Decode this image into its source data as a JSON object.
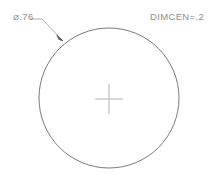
{
  "drawing": {
    "type": "cad-dimension-illustration",
    "background_color": "#ffffff",
    "geometry_color": "#6b6b6b",
    "centermark_color": "#c9c9c9",
    "text_color": "#8e8e8e",
    "circle": {
      "center_x": 109,
      "center_y": 98,
      "radius": 70
    },
    "center_mark": {
      "name": "center-mark-cross",
      "half_width": 14,
      "half_height": 15,
      "size_value": ".2"
    },
    "leader": {
      "shoulder_start_x": 30,
      "shoulder_start_y": 19,
      "shoulder_end_x": 42,
      "shoulder_end_y": 19,
      "arrow_tip_x": 63,
      "arrow_tip_y": 41
    }
  },
  "labels": {
    "diameter_symbol": "⌀",
    "diameter_value": ".76",
    "diameter_text": "⌀.76",
    "dimcen_text": "DIMCEN=.2",
    "dimcen_variable": "DIMCEN",
    "dimcen_value": ".2"
  }
}
